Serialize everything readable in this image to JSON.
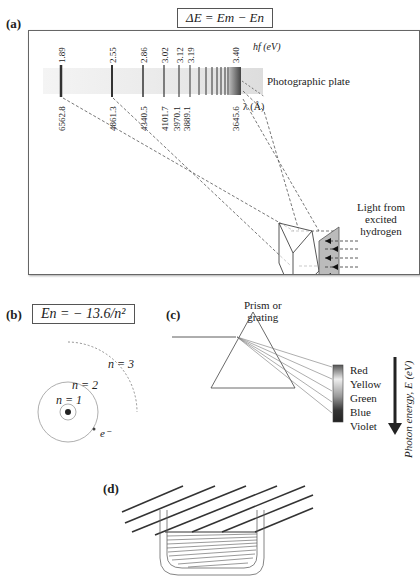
{
  "panel_a": {
    "label": "(a)",
    "formula": "ΔE  =  E_m − E_n",
    "formula_display": "ΔE  =  Em − En",
    "energy_axis_label": "hf (eV)",
    "wavelength_axis_label": "λ (Å)",
    "plate_label": "Photographic plate",
    "prism_label_1": "Prism or",
    "prism_label_2": "grating",
    "source_label_1": "Light from",
    "source_label_2": "excited",
    "source_label_3": "hydrogen",
    "lines": [
      {
        "energy": "1.89",
        "wavelength": "6562.8"
      },
      {
        "energy": "2.55",
        "wavelength": "4861.3"
      },
      {
        "energy": "2.86",
        "wavelength": "4340.5"
      },
      {
        "energy": "3.02",
        "wavelength": "4101.7"
      },
      {
        "energy": "3.12",
        "wavelength": "3970.1"
      },
      {
        "energy": "3.19",
        "wavelength": "3889.1"
      },
      {
        "energy": "3.40",
        "wavelength": "3645.6"
      }
    ]
  },
  "panel_b": {
    "label": "(b)",
    "formula_display": "En  =  − 13.6/n²",
    "orbit_labels": [
      "n = 1",
      "n = 2",
      "n = 3"
    ],
    "electron_label": "e⁻"
  },
  "panel_c": {
    "label": "(c)",
    "colors": [
      "Red",
      "Yellow",
      "Green",
      "Blue",
      "Violet"
    ],
    "axis_label": "Photon energy, E (eV)"
  },
  "panel_d": {
    "label": "(d)"
  }
}
